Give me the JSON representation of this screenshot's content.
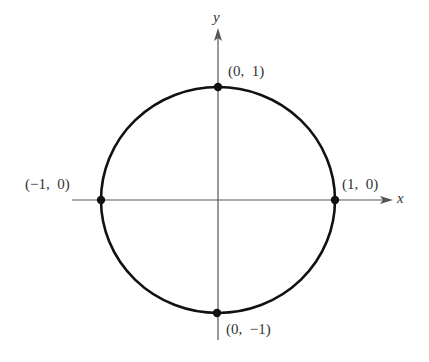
{
  "figure": {
    "type": "unit-circle",
    "axes": {
      "x_label": "x",
      "y_label": "y"
    },
    "points": [
      {
        "id": "top",
        "label": "(0,  1)",
        "coord": [
          0,
          1
        ]
      },
      {
        "id": "left",
        "label": "(−1,  0)",
        "coord": [
          -1,
          0
        ]
      },
      {
        "id": "right",
        "label": "(1,  0)",
        "coord": [
          1,
          0
        ]
      },
      {
        "id": "bottom",
        "label": "(0,  −1)",
        "coord": [
          0,
          -1
        ]
      }
    ],
    "colors": {
      "curve": "#111111",
      "axes": "#555555",
      "text": "#333333",
      "background": "#ffffff"
    }
  }
}
